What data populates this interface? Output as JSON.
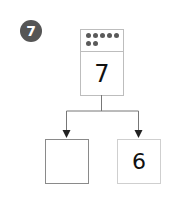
{
  "problem": {
    "number": "7",
    "badge_color": "#555555"
  },
  "whole": {
    "value": "7",
    "dot_count": 7
  },
  "parts": [
    {
      "value": ""
    },
    {
      "value": "6"
    }
  ]
}
